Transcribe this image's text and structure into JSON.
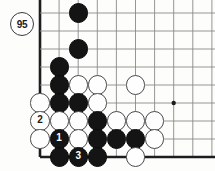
{
  "figure": {
    "kind": "go-board-diagram",
    "caption_badge": "95",
    "board_region": "bottom-left corner",
    "grid": {
      "origin_x": 40,
      "origin_y": 157,
      "step_x": 19.1,
      "step_y": 18.0,
      "cols": 10,
      "rows": 9,
      "edge_left": true,
      "edge_bottom": true,
      "line_color": "#8a8a8a",
      "edge_color": "#1d1d1d",
      "background": "#fdfdfc"
    },
    "star_points": [
      {
        "col": 8,
        "row": 4
      }
    ],
    "colors": {
      "black_stone": "#141414",
      "white_stone": "#fefefe",
      "stone_outline": "#4a4a4a",
      "label_text_on_black": "#ffffff",
      "label_text_on_white": "#1a1a1a"
    },
    "stones": [
      {
        "name": "stone-black-c3r9",
        "color": "black",
        "col": 3,
        "row": 9,
        "label": ""
      },
      {
        "name": "stone-black-c3r7",
        "color": "black",
        "col": 3,
        "row": 7,
        "label": ""
      },
      {
        "name": "stone-black-c2r6",
        "color": "black",
        "col": 2,
        "row": 6,
        "label": ""
      },
      {
        "name": "stone-black-c2r5",
        "color": "black",
        "col": 2,
        "row": 5,
        "label": ""
      },
      {
        "name": "stone-white-c3r5",
        "color": "white",
        "col": 3,
        "row": 5,
        "label": ""
      },
      {
        "name": "stone-white-c4r5",
        "color": "white",
        "col": 4,
        "row": 5,
        "label": ""
      },
      {
        "name": "stone-white-c6r5",
        "color": "white",
        "col": 6,
        "row": 5,
        "label": ""
      },
      {
        "name": "stone-white-c1r4",
        "color": "white",
        "col": 1,
        "row": 4,
        "label": ""
      },
      {
        "name": "stone-black-c2r4",
        "color": "black",
        "col": 2,
        "row": 4,
        "label": ""
      },
      {
        "name": "stone-black-c3r4",
        "color": "black",
        "col": 3,
        "row": 4,
        "label": ""
      },
      {
        "name": "stone-white-c4r4",
        "color": "white",
        "col": 4,
        "row": 4,
        "label": ""
      },
      {
        "name": "stone-white-c1r3",
        "color": "white",
        "col": 1,
        "row": 3,
        "label": "2"
      },
      {
        "name": "stone-white-c2r3",
        "color": "white",
        "col": 2,
        "row": 3,
        "label": ""
      },
      {
        "name": "stone-white-c3r3",
        "color": "white",
        "col": 3,
        "row": 3,
        "label": ""
      },
      {
        "name": "stone-black-c4r3",
        "color": "black",
        "col": 4,
        "row": 3,
        "label": ""
      },
      {
        "name": "stone-white-c5r3",
        "color": "white",
        "col": 5,
        "row": 3,
        "label": ""
      },
      {
        "name": "stone-white-c6r3",
        "color": "white",
        "col": 6,
        "row": 3,
        "label": ""
      },
      {
        "name": "stone-white-c7r3",
        "color": "white",
        "col": 7,
        "row": 3,
        "label": ""
      },
      {
        "name": "stone-white-c1r2",
        "color": "white",
        "col": 1,
        "row": 2,
        "label": ""
      },
      {
        "name": "stone-black-c2r2",
        "color": "black",
        "col": 2,
        "row": 2,
        "label": "1"
      },
      {
        "name": "stone-white-c3r2",
        "color": "white",
        "col": 3,
        "row": 2,
        "label": ""
      },
      {
        "name": "stone-black-c4r2",
        "color": "black",
        "col": 4,
        "row": 2,
        "label": ""
      },
      {
        "name": "stone-black-c5r2",
        "color": "black",
        "col": 5,
        "row": 2,
        "label": ""
      },
      {
        "name": "stone-black-c6r2",
        "color": "black",
        "col": 6,
        "row": 2,
        "label": ""
      },
      {
        "name": "stone-white-c7r2",
        "color": "white",
        "col": 7,
        "row": 2,
        "label": ""
      },
      {
        "name": "stone-black-c2r1",
        "color": "black",
        "col": 2,
        "row": 1,
        "label": ""
      },
      {
        "name": "stone-black-c3r1",
        "color": "black",
        "col": 3,
        "row": 1,
        "label": "3"
      },
      {
        "name": "stone-black-c4r1",
        "color": "black",
        "col": 4,
        "row": 1,
        "label": ""
      },
      {
        "name": "stone-white-c6r1",
        "color": "white",
        "col": 6,
        "row": 1,
        "label": ""
      }
    ],
    "move_badge": {
      "text": "95",
      "x": 10,
      "y": 12,
      "size": 24
    }
  }
}
